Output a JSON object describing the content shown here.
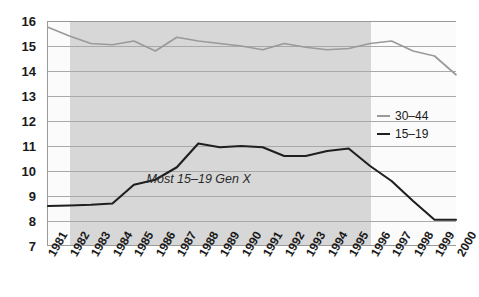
{
  "chart_data": {
    "type": "line",
    "title": "",
    "xlabel": "",
    "ylabel": "",
    "xlim": [
      1981,
      2000
    ],
    "ylim": [
      7,
      16
    ],
    "grid": true,
    "legend_position": "right-middle",
    "categories": [
      1981,
      1982,
      1983,
      1984,
      1985,
      1986,
      1987,
      1988,
      1989,
      1990,
      1991,
      1992,
      1993,
      1994,
      1995,
      1996,
      1997,
      1998,
      1999,
      2000
    ],
    "x_tick_labels": [
      "1981",
      "1982",
      "1983",
      "1984",
      "1985",
      "1986",
      "1987",
      "1988",
      "1989",
      "1990",
      "1991",
      "1992",
      "1993",
      "1994",
      "1995",
      "1996",
      "1997",
      "1998",
      "1999",
      "2000"
    ],
    "y_tick_labels": [
      "16",
      "15",
      "14",
      "13",
      "12",
      "11",
      "10",
      "9",
      "8",
      "7"
    ],
    "y_ticks": [
      16,
      15,
      14,
      13,
      12,
      11,
      10,
      9,
      8,
      7
    ],
    "series": [
      {
        "name": "30-44",
        "legend_label": "30–44",
        "color": "#9a9a9a",
        "values": [
          15.75,
          15.4,
          15.1,
          15.05,
          15.2,
          14.8,
          15.35,
          15.2,
          15.1,
          15.0,
          14.85,
          15.1,
          14.95,
          14.85,
          14.9,
          15.1,
          15.2,
          14.8,
          14.6,
          13.85
        ]
      },
      {
        "name": "15-19",
        "legend_label": "15–19",
        "color": "#1f1f1f",
        "values": [
          8.6,
          8.62,
          8.65,
          8.7,
          9.45,
          9.65,
          10.15,
          11.1,
          10.95,
          11.0,
          10.95,
          10.6,
          10.6,
          10.8,
          10.9,
          10.2,
          9.6,
          8.8,
          8.05,
          8.05
        ]
      }
    ],
    "annotations": [
      {
        "text": "Most 15–19 Gen X",
        "x_year": 1988,
        "y_value": 9.7
      }
    ],
    "shaded_band": {
      "start_year": 1982,
      "end_year": 1996,
      "color": "#d7d7d7"
    }
  }
}
